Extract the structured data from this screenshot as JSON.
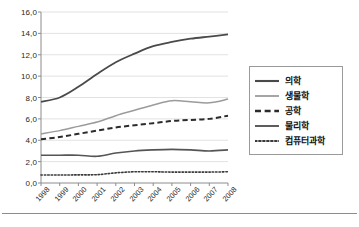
{
  "chart_data": {
    "type": "line",
    "title": "",
    "subtitle": "",
    "xlabel": "",
    "ylabel": "",
    "categories": [
      "1998",
      "1999",
      "2000",
      "2001",
      "2002",
      "2003",
      "2004",
      "2005",
      "2006",
      "2007",
      "2008"
    ],
    "x_tick_labels": [
      "1998",
      "1999",
      "2000",
      "2001",
      "2002",
      "2003",
      "2004",
      "2005",
      "2006",
      "2007",
      "2008"
    ],
    "y_tick_labels": [
      "0,0",
      "2,0",
      "4,0",
      "6,0",
      "8,0",
      "10,0",
      "12,0",
      "14,0",
      "16,0"
    ],
    "y_tick_values": [
      0,
      2,
      4,
      6,
      8,
      10,
      12,
      14,
      16
    ],
    "ylim": [
      0,
      16
    ],
    "xlim_labels": [
      "1998",
      "2008"
    ],
    "grid": "horizontal",
    "legend_position": "right",
    "decimal_separator": ",",
    "series": [
      {
        "name": "의학",
        "style": "solid",
        "color": "#4a4a4a",
        "width": 1.8,
        "values": [
          7.6,
          8.0,
          9.0,
          10.2,
          11.3,
          12.1,
          12.8,
          13.2,
          13.5,
          13.7,
          13.9
        ]
      },
      {
        "name": "생물학",
        "style": "solid",
        "color": "#9b9b9b",
        "width": 1.5,
        "values": [
          4.6,
          4.9,
          5.3,
          5.7,
          6.3,
          6.8,
          7.3,
          7.7,
          7.6,
          7.5,
          7.85
        ]
      },
      {
        "name": "공학",
        "style": "dashed",
        "color": "#2b2b2b",
        "width": 2.0,
        "values": [
          4.1,
          4.3,
          4.6,
          4.9,
          5.2,
          5.4,
          5.6,
          5.8,
          5.9,
          6.0,
          6.3
        ]
      },
      {
        "name": "물리학",
        "style": "solid",
        "color": "#555555",
        "width": 1.6,
        "values": [
          2.6,
          2.6,
          2.6,
          2.5,
          2.8,
          3.0,
          3.1,
          3.15,
          3.1,
          3.0,
          3.1
        ]
      },
      {
        "name": "컴퓨터과학",
        "style": "dotted",
        "color": "#3a3a3a",
        "width": 1.6,
        "values": [
          0.75,
          0.75,
          0.76,
          0.78,
          0.95,
          1.05,
          1.05,
          1.02,
          1.02,
          1.02,
          1.05
        ]
      }
    ]
  },
  "legend": {
    "items": [
      {
        "label": "의학"
      },
      {
        "label": "생물학"
      },
      {
        "label": "공학"
      },
      {
        "label": "물리학"
      },
      {
        "label": "컴퓨터과학"
      }
    ]
  },
  "colors": {
    "axis": "#8c8c8c",
    "grid": "#e2e2e2",
    "legend_border": "#9a9a9a",
    "rule": "#8c8c8c",
    "background": "#ffffff"
  }
}
